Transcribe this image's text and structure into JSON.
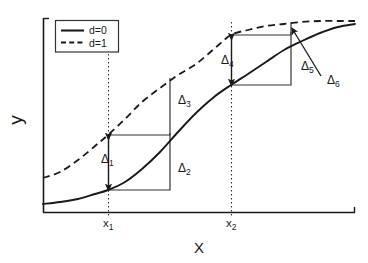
{
  "chart_data": {
    "type": "line",
    "title": "",
    "xlabel": "X",
    "ylabel": "y",
    "grid": false,
    "legend_position": "top-left",
    "axis": {
      "x_range_px": [
        43,
        355
      ],
      "y_range_px": [
        18,
        212
      ],
      "x_ticks": [
        "x_1",
        "x_2"
      ],
      "x_tick_positions_px": [
        108,
        231
      ],
      "y_ticks": []
    },
    "series": [
      {
        "name": "d=0",
        "style": "solid",
        "color": "#1a1a1a",
        "points": [
          [
            43,
            204
          ],
          [
            60,
            202
          ],
          [
            78,
            199
          ],
          [
            95,
            194
          ],
          [
            108,
            190
          ],
          [
            125,
            182
          ],
          [
            142,
            169
          ],
          [
            160,
            152
          ],
          [
            178,
            132
          ],
          [
            196,
            113
          ],
          [
            214,
            97
          ],
          [
            231,
            85
          ],
          [
            248,
            74
          ],
          [
            266,
            62
          ],
          [
            284,
            50
          ],
          [
            302,
            41
          ],
          [
            320,
            33
          ],
          [
            338,
            27
          ],
          [
            355,
            24
          ]
        ]
      },
      {
        "name": "d=1",
        "style": "dashed",
        "color": "#1a1a1a",
        "points": [
          [
            43,
            178
          ],
          [
            60,
            172
          ],
          [
            78,
            160
          ],
          [
            95,
            146
          ],
          [
            108,
            135
          ],
          [
            125,
            119
          ],
          [
            142,
            102
          ],
          [
            160,
            88
          ],
          [
            178,
            75
          ],
          [
            196,
            64
          ],
          [
            214,
            49
          ],
          [
            231,
            35
          ],
          [
            248,
            30
          ],
          [
            266,
            26
          ],
          [
            284,
            24
          ],
          [
            302,
            22
          ],
          [
            320,
            21
          ],
          [
            338,
            21
          ],
          [
            355,
            21
          ]
        ]
      }
    ],
    "legend_entries": [
      {
        "label": "d=0",
        "style": "solid"
      },
      {
        "label": "d=1",
        "style": "dashed"
      }
    ],
    "annotations": [
      {
        "label": "Δ",
        "sub": "1",
        "x": 101,
        "y": 163,
        "desc": "vertical gap between curves at x1"
      },
      {
        "label": "Δ",
        "sub": "2",
        "x": 178,
        "y": 172,
        "desc": "solid curve rise from x1 step"
      },
      {
        "label": "Δ",
        "sub": "3",
        "x": 178,
        "y": 104,
        "desc": "dashed curve rise from x1 step"
      },
      {
        "label": "Δ",
        "sub": "4",
        "x": 221,
        "y": 64,
        "desc": "vertical gap between curves at x2"
      },
      {
        "label": "Δ",
        "sub": "5",
        "x": 301,
        "y": 70,
        "desc": "solid curve rise from x2 step"
      },
      {
        "label": "Δ",
        "sub": "6",
        "x": 327,
        "y": 84,
        "desc": "dashed curve rise from x2 step, arrow callout"
      }
    ],
    "delta_geometry": {
      "x1": 108,
      "x2": 231,
      "x1_solid_y": 190,
      "x1_dashed_y": 135,
      "x2_solid_y": 85,
      "x2_dashed_y": 35,
      "step1_right_x": 170,
      "step1_solid_top_y": 133,
      "step1_dashed_top_y": 78,
      "step2_right_x": 291,
      "step2_solid_top_y": 32,
      "step2_dashed_top_y": 22,
      "delta6_arrow_from": [
        321,
        76
      ],
      "delta6_arrow_to": [
        293,
        30
      ]
    }
  },
  "labels": {
    "y_axis": "y",
    "x_axis": "X",
    "tick_x1_base": "x",
    "tick_x1_sub": "1",
    "tick_x2_base": "x",
    "tick_x2_sub": "2",
    "legend_d0": "d=0",
    "legend_d1": "d=1",
    "delta_glyph": "Δ"
  },
  "colors": {
    "ink": "#1a1a1a",
    "thin": "#333333",
    "background": "#ffffff"
  }
}
